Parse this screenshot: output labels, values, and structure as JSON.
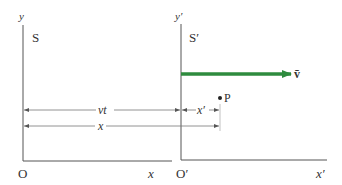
{
  "frames": {
    "S": {
      "name": "S",
      "y_axis_label": "y",
      "x_axis_label": "x",
      "origin_label": "O"
    },
    "S_prime": {
      "name": "S′",
      "y_axis_label": "y′",
      "x_axis_label": "x′",
      "origin_label": "O′"
    }
  },
  "velocity": {
    "label": "v̄",
    "color": "#2e8b3e"
  },
  "point": {
    "label": "P"
  },
  "dimensions": {
    "vt_label": "vt",
    "x_prime_label": "x′",
    "x_label": "x"
  },
  "colors": {
    "axis": "#555555",
    "dimension": "#666666",
    "text": "#333333"
  }
}
